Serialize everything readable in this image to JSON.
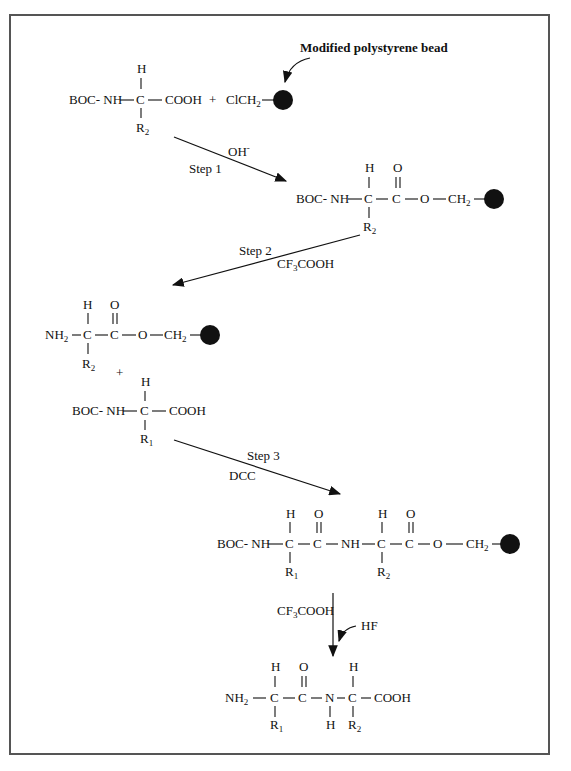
{
  "diagram": {
    "annotation": "Modified polystyrene bead",
    "steps": [
      {
        "label": "Step 1",
        "reagent": "OH",
        "reagent_sup": "-"
      },
      {
        "label": "Step 2",
        "reagent": "CF",
        "reagent_sub": "3",
        "reagent_tail": "COOH"
      },
      {
        "label": "Step 3",
        "reagent": "DCC"
      },
      {
        "label": "",
        "reagent": "CF",
        "reagent_sub": "3",
        "reagent_tail": "COOH",
        "extra_reagent": "HF"
      }
    ],
    "molecules": {
      "m1": {
        "left": "BOC- NH",
        "c": "C",
        "right": "COOH",
        "top": "H",
        "bottom": "R",
        "bottom_sub": "2"
      },
      "reagent1": {
        "text": "ClCH",
        "sub": "2",
        "plus": "+"
      },
      "m2": {
        "left": "BOC- NH",
        "c1": "C",
        "c2": "C",
        "o": "O",
        "ch2": "CH",
        "ch2_sub": "2",
        "top_h": "H",
        "top_o": "O",
        "bottom": "R",
        "bottom_sub": "2"
      },
      "m3": {
        "left": "NH",
        "left_sub": "2",
        "c1": "C",
        "c2": "C",
        "o": "O",
        "ch2": "CH",
        "ch2_sub": "2",
        "top_h": "H",
        "top_o": "O",
        "bottom": "R",
        "bottom_sub": "2"
      },
      "plus2": "+",
      "m4": {
        "left": "BOC- NH",
        "c": "C",
        "right": "COOH",
        "top": "H",
        "bottom": "R",
        "bottom_sub": "1"
      },
      "m5": {
        "left": "BOC- NH",
        "c1": "C",
        "c2": "C",
        "nh": "NH",
        "c3": "C",
        "c4": "C",
        "o": "O",
        "ch2": "CH",
        "ch2_sub": "2",
        "top_h1": "H",
        "top_o1": "O",
        "top_h2": "H",
        "top_o2": "O",
        "bottom1": "R",
        "bottom1_sub": "1",
        "bottom2": "R",
        "bottom2_sub": "2"
      },
      "m6": {
        "left": "NH",
        "left_sub": "2",
        "c1": "C",
        "c2": "C",
        "n": "N",
        "c3": "C",
        "right": "COOH",
        "top_h1": "H",
        "top_o": "O",
        "top_h2": "H",
        "n_h": "H",
        "bottom1": "R",
        "bottom1_sub": "1",
        "bottom2": "R",
        "bottom2_sub": "2"
      }
    }
  }
}
